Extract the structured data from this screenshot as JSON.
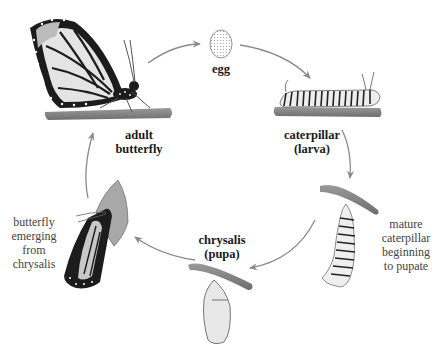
{
  "diagram": {
    "stages": [
      {
        "id": "adult",
        "lines": [
          "adult",
          "butterfly"
        ],
        "style": "bold"
      },
      {
        "id": "egg",
        "lines": [
          "egg"
        ],
        "style": "bold"
      },
      {
        "id": "caterpillar",
        "lines": [
          "caterpillar",
          "(larva)"
        ],
        "style": "bold"
      },
      {
        "id": "prepupa",
        "lines": [
          "mature",
          "caterpillar",
          "beginning",
          "to pupate"
        ],
        "style": "plain"
      },
      {
        "id": "chrysalis",
        "lines": [
          "chrysalis",
          "(pupa)"
        ],
        "style": "bold"
      },
      {
        "id": "emerging",
        "lines": [
          "butterfly",
          "emerging",
          "from",
          "chrysalis"
        ],
        "style": "plain"
      }
    ],
    "arrows": [
      {
        "from": "adult",
        "to": "egg"
      },
      {
        "from": "egg",
        "to": "caterpillar"
      },
      {
        "from": "caterpillar",
        "to": "prepupa"
      },
      {
        "from": "prepupa",
        "to": "chrysalis"
      },
      {
        "from": "chrysalis",
        "to": "emerging"
      },
      {
        "from": "emerging",
        "to": "adult"
      }
    ],
    "colors": {
      "arrow": "#8a8a8a",
      "branch": "#7a7a7a",
      "wing_light": "#e6e6e6",
      "wing_dark": "#1a1a1a",
      "chrysalis": "#e8e8e8",
      "text": "#222222"
    }
  }
}
